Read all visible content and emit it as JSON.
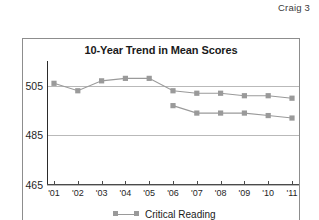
{
  "page": {
    "header": "Craig 3"
  },
  "figure": {
    "title": "10-Year Trend in Mean Scores"
  },
  "chart_data": {
    "type": "line",
    "title": "10-Year Trend in Mean Scores",
    "xlabel": "",
    "ylabel": "",
    "x": [
      "'01",
      "'02",
      "'03",
      "'04",
      "'05",
      "'06",
      "'07",
      "'08",
      "'09",
      "'10",
      "'11"
    ],
    "ylim": [
      465,
      515
    ],
    "yticks": [
      465,
      485,
      505
    ],
    "ytick_labels": [
      "465",
      "485",
      "505"
    ],
    "grid": true,
    "legend_position": "bottom",
    "marker": "square",
    "series": [
      {
        "name": "Critical Reading",
        "color": "#9a9a9a",
        "values": [
          506,
          503,
          507,
          508,
          508,
          503,
          502,
          502,
          501,
          501,
          500
        ]
      },
      {
        "name": "Writing",
        "color": "#9a9a9a",
        "values": [
          null,
          null,
          null,
          null,
          null,
          497,
          494,
          494,
          494,
          493,
          492
        ]
      }
    ]
  }
}
